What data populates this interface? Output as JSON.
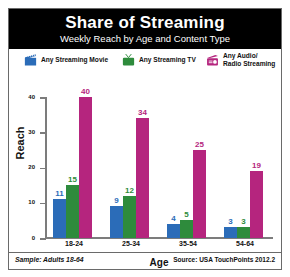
{
  "header": {
    "title": "Share of Streaming",
    "subtitle": "Weekly Reach by Age and Content Type"
  },
  "legend": [
    {
      "label": "Any Streaming Movie",
      "icon": "clapperboard-icon",
      "color": "#2B6CB8"
    },
    {
      "label": "Any Streaming TV",
      "icon": "television-icon",
      "color": "#2E8B3C"
    },
    {
      "label": "Any Audio/\nRadio Streaming",
      "icon": "radio-icon",
      "color": "#B5257E"
    }
  ],
  "footer": {
    "sample": "Sample: Adults 18-64",
    "source": "Source: USA TouchPoints 2012.2"
  },
  "chart_data": {
    "type": "bar",
    "title": "Share of Streaming",
    "subtitle": "Weekly Reach by Age and Content Type",
    "categories": [
      "18-24",
      "25-34",
      "35-54",
      "54-64"
    ],
    "series": [
      {
        "name": "Any Streaming Movie",
        "color": "#2B6CB8",
        "values": [
          11,
          9,
          4,
          3
        ]
      },
      {
        "name": "Any Streaming TV",
        "color": "#2E8B3C",
        "values": [
          15,
          12,
          5,
          3
        ]
      },
      {
        "name": "Any Audio/Radio Streaming",
        "color": "#B5257E",
        "values": [
          40,
          34,
          25,
          19
        ]
      }
    ],
    "xlabel": "Age",
    "ylabel": "Reach",
    "ylim": [
      0,
      40
    ],
    "yticks": [
      0,
      10,
      20,
      30,
      40
    ],
    "grid": false,
    "legend_position": "top",
    "data_labels": true
  }
}
